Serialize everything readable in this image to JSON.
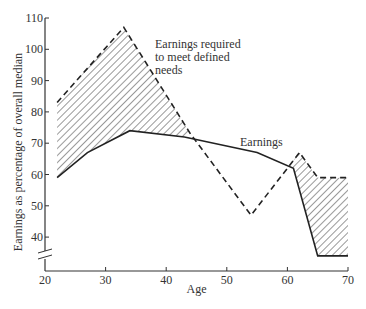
{
  "chart_data": {
    "type": "line",
    "title": "",
    "xlabel": "Age",
    "ylabel": "Earnings as percentage of overall median",
    "xlim": [
      20,
      70
    ],
    "ylim": [
      32,
      110
    ],
    "xticks": [
      20,
      30,
      40,
      50,
      60,
      70
    ],
    "yticks": [
      40,
      50,
      60,
      70,
      80,
      90,
      100,
      110
    ],
    "axis_break": "y-axis broken between 0 and 40",
    "grid": false,
    "legend": "none (direct labels)",
    "shading": "hatched area between the two curves",
    "series": [
      {
        "name": "Earnings required to meet defined needs",
        "style": "dashed",
        "points": [
          [
            22,
            83
          ],
          [
            33,
            107
          ],
          [
            44,
            73
          ],
          [
            54,
            47
          ],
          [
            62,
            67
          ],
          [
            65,
            59
          ],
          [
            70,
            59
          ]
        ]
      },
      {
        "name": "Earnings",
        "style": "solid",
        "points": [
          [
            22,
            59
          ],
          [
            27,
            67
          ],
          [
            34,
            74
          ],
          [
            43,
            72
          ],
          [
            55,
            67
          ],
          [
            61,
            62
          ],
          [
            65,
            34
          ],
          [
            70,
            34
          ]
        ]
      }
    ],
    "annotations": [
      {
        "text": [
          "Earnings required",
          "to meet defined",
          "needs"
        ],
        "near": [
          45,
          98
        ]
      },
      {
        "text": [
          "Earnings"
        ],
        "near": [
          51,
          69
        ]
      }
    ]
  }
}
